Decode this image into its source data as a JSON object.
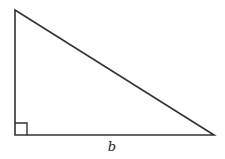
{
  "diagram": {
    "type": "right-triangle",
    "vertices": {
      "top_left": [
        15,
        10
      ],
      "bottom_left": [
        15,
        135
      ],
      "bottom_right": [
        214,
        135
      ]
    },
    "right_angle_marker": {
      "corner": "bottom_left",
      "size": 12
    },
    "labels": {
      "base": "b"
    },
    "stroke_color": "#333333"
  }
}
